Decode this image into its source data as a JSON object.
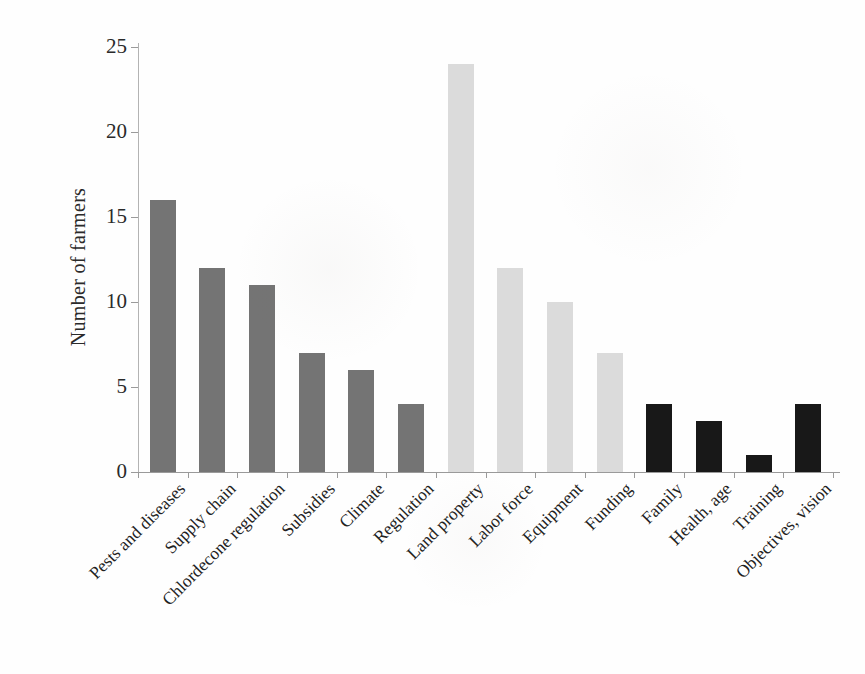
{
  "chart_data": {
    "type": "bar",
    "title": "",
    "categories": [
      "Pests and diseases",
      "Supply chain",
      "Chlordecone regulation",
      "Subsidies",
      "Climate",
      "Regulation",
      "Land property",
      "Labor force",
      "Equipment",
      "Funding",
      "Family",
      "Health, age",
      "Training",
      "Objectives, vision"
    ],
    "values": [
      16,
      12,
      11,
      7,
      6,
      4,
      24,
      12,
      10,
      7,
      4,
      3,
      1,
      4
    ],
    "bar_colors": [
      "#747474",
      "#747474",
      "#747474",
      "#747474",
      "#747474",
      "#747474",
      "#dbdbdb",
      "#dbdbdb",
      "#dbdbdb",
      "#dbdbdb",
      "#181818",
      "#181818",
      "#181818",
      "#181818"
    ],
    "xlabel": "",
    "ylabel": "Number of farmers",
    "ylim": [
      0,
      25
    ],
    "yticks": [
      0,
      5,
      10,
      15,
      20,
      25
    ],
    "x_tick_label_rotation_deg": -45,
    "grid": false,
    "legend": false,
    "axis_color": "#9a9a9a",
    "text_color": "#262626"
  }
}
